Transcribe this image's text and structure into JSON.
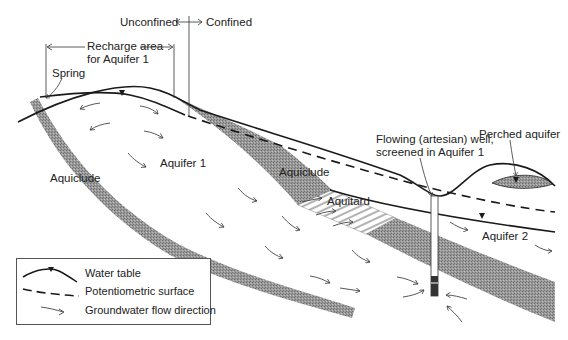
{
  "diagram": {
    "title_labels": {
      "unconfined": "Unconfined",
      "confined": "Confined",
      "recharge_line1": "Recharge area",
      "recharge_line2": "for Aquifer 1",
      "spring": "Spring",
      "aquifer1": "Aquifer 1",
      "aquiclude_left": "Aquiclude",
      "aquiclude_mid": "Aquiclude",
      "aquitard": "Aquitard",
      "well_line1": "Flowing (artesian) well,",
      "well_line2": "screened in Aquifer 1",
      "perched": "Perched aquifer",
      "aquifer2": "Aquifer 2"
    },
    "colors": {
      "confining_fill": "#8f8f8f",
      "line": "#1a1a1a",
      "background": "#ffffff"
    }
  },
  "legend": {
    "items": [
      {
        "symbol": "water-table-line",
        "label": "Water table"
      },
      {
        "symbol": "dashed-line",
        "label": "Potentiometric surface"
      },
      {
        "symbol": "flow-arrow",
        "label": "Groundwater flow direction"
      }
    ]
  }
}
